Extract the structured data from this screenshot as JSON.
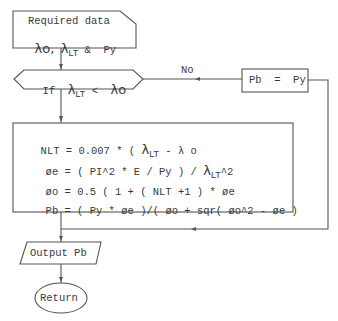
{
  "flowchart": {
    "input_box": {
      "line1": "Required data",
      "line2_parts": {
        "lambda_o": "λo,",
        "lambda": "λ",
        "lt_sub": "LT",
        "amp_py": " &  Py"
      }
    },
    "decision": {
      "if": "If",
      "lambda_lt": "λ",
      "lt_sub": "LT",
      "lt_op": "<",
      "lambda_o": "λo",
      "no_label": "No"
    },
    "assign_box": {
      "text": "Pb  =  Py"
    },
    "process_box": {
      "line1": {
        "pre": "NLT = 0.007 * ( ",
        "lambda": "λ",
        "sub": "LT",
        "post": " - λ o"
      },
      "line2": {
        "phi": "ø",
        "pre": "e = ( PI^2 * E / Py ) / ",
        "lambda": "λ",
        "sub": "LT",
        "post": "^2"
      },
      "line3": {
        "phi": "ø",
        "text": "o = 0.5 ( 1 + ( NLT +1 ) * ",
        "phi2": "ø",
        "post": "e"
      },
      "line4": {
        "pre": "Pb = ( Py * ",
        "phi": "ø",
        "mid": "e )/( ",
        "phi2": "ø",
        "mid2": "o + sqr( ",
        "phi3": "ø",
        "mid3": "o^2 - ",
        "phi4": "ø",
        "post": "e )"
      }
    },
    "output_box": {
      "text": "Output Pb"
    },
    "terminal": {
      "text": "Return"
    },
    "colors": {
      "line": "#4a4a4a",
      "text": "#3a3a3a",
      "background": "#ffffff"
    }
  }
}
